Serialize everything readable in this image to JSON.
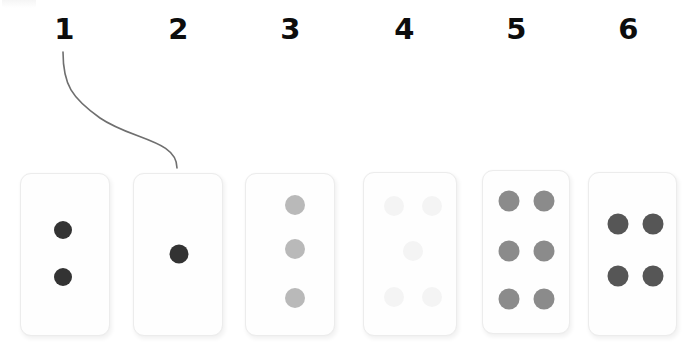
{
  "scene": {
    "title": "Domino cards row with numbered labels",
    "background_color": "#ffffff",
    "width": 691,
    "height": 346
  },
  "chrome_fragment": {
    "name": "clipped-toolbar-fragment",
    "visible": true
  },
  "labels": [
    {
      "text": "1",
      "x": 44,
      "y": 12
    },
    {
      "text": "2",
      "x": 158,
      "y": 12
    },
    {
      "text": "3",
      "x": 270,
      "y": 12
    },
    {
      "text": "4",
      "x": 384,
      "y": 12
    },
    {
      "text": "5",
      "x": 496,
      "y": 12
    },
    {
      "text": "6",
      "x": 608,
      "y": 12
    }
  ],
  "connector": {
    "name": "curve-from-label-1-to-card-2",
    "color": "#6f6f6f",
    "width": 1.6,
    "path": "M 63,52 C 63,85 72,98 100,118 C 132,140 177,140 177,168"
  },
  "cards": [
    {
      "id": "card-1",
      "label": "1",
      "pip_count": 2,
      "pip_color": "#333333",
      "x": 20,
      "y": 173,
      "w": 90,
      "h": 163,
      "pip_radius": 9,
      "pips": [
        {
          "cx": 42,
          "cy": 56
        },
        {
          "cx": 42,
          "cy": 103
        }
      ]
    },
    {
      "id": "card-2",
      "label": "2",
      "pip_count": 1,
      "pip_color": "#333333",
      "x": 133,
      "y": 173,
      "w": 90,
      "h": 163,
      "pip_radius": 9.5,
      "pips": [
        {
          "cx": 45,
          "cy": 80
        }
      ]
    },
    {
      "id": "card-3",
      "label": "3",
      "pip_count": 3,
      "pip_color": "#b9b9b9",
      "x": 245,
      "y": 173,
      "w": 90,
      "h": 163,
      "pip_radius": 10,
      "pips": [
        {
          "cx": 49,
          "cy": 31
        },
        {
          "cx": 49,
          "cy": 75
        },
        {
          "cx": 49,
          "cy": 124
        }
      ]
    },
    {
      "id": "card-4",
      "label": "4",
      "pip_count": 5,
      "pip_color": "#f4f4f4",
      "x": 363,
      "y": 172,
      "w": 94,
      "h": 164,
      "pip_radius": 10,
      "pips": [
        {
          "cx": 30,
          "cy": 33
        },
        {
          "cx": 68,
          "cy": 33
        },
        {
          "cx": 49,
          "cy": 78
        },
        {
          "cx": 30,
          "cy": 124
        },
        {
          "cx": 68,
          "cy": 124
        }
      ]
    },
    {
      "id": "card-5",
      "label": "5",
      "pip_count": 6,
      "pip_color": "#8b8b8b",
      "x": 482,
      "y": 170,
      "w": 88,
      "h": 164,
      "pip_radius": 10.5,
      "pips": [
        {
          "cx": 26,
          "cy": 30
        },
        {
          "cx": 61,
          "cy": 30
        },
        {
          "cx": 26,
          "cy": 80
        },
        {
          "cx": 61,
          "cy": 80
        },
        {
          "cx": 26,
          "cy": 128
        },
        {
          "cx": 61,
          "cy": 128
        }
      ]
    },
    {
      "id": "card-6",
      "label": "6",
      "pip_count": 4,
      "pip_color": "#565656",
      "x": 588,
      "y": 172,
      "w": 89,
      "h": 164,
      "pip_radius": 10.5,
      "pips": [
        {
          "cx": 29,
          "cy": 51
        },
        {
          "cx": 64,
          "cy": 51
        },
        {
          "cx": 29,
          "cy": 103
        },
        {
          "cx": 64,
          "cy": 103
        }
      ]
    }
  ]
}
